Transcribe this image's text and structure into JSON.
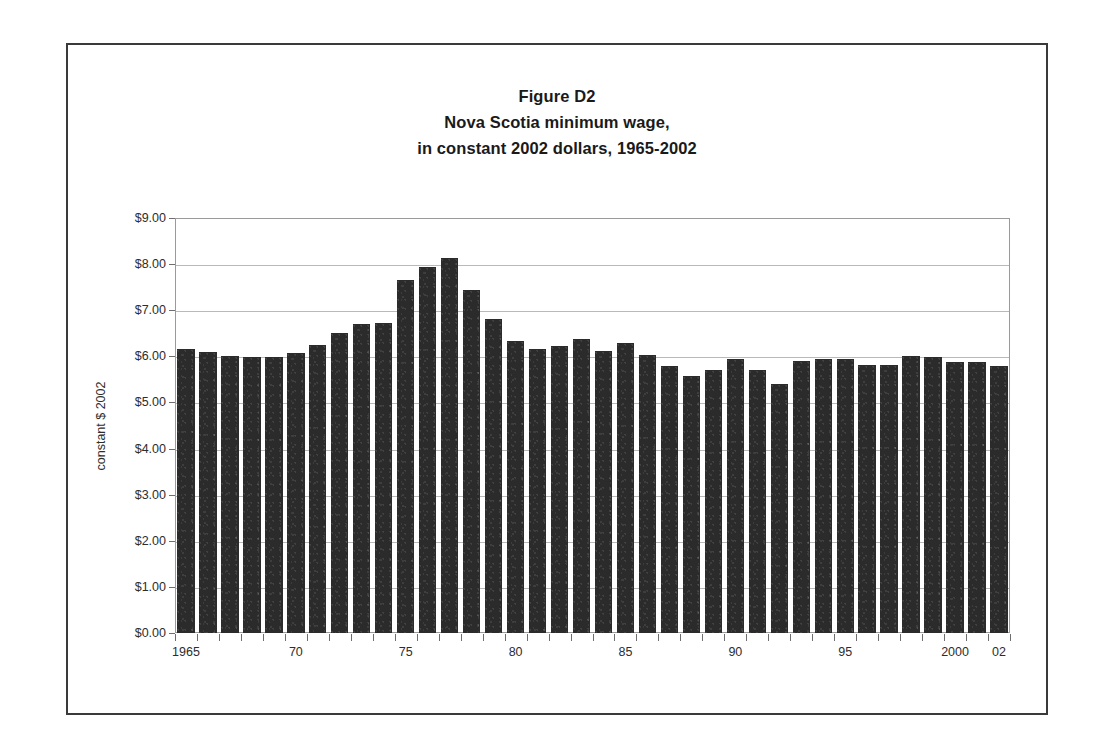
{
  "figure": {
    "title_lines": [
      "Figure D2",
      "Nova Scotia minimum wage,",
      "in constant 2002 dollars, 1965-2002"
    ],
    "border_color": "#3a3a3a"
  },
  "chart_data": {
    "type": "bar",
    "title": "Figure D2 Nova Scotia minimum wage, in constant 2002 dollars, 1965-2002",
    "xlabel": "",
    "ylabel": "constant $ 2002",
    "ylim": [
      0,
      9
    ],
    "ytick_step": 1,
    "ytick_labels": [
      "$0.00",
      "$1.00",
      "$2.00",
      "$3.00",
      "$4.00",
      "$5.00",
      "$6.00",
      "$7.00",
      "$8.00",
      "$9.00"
    ],
    "ytick_values": [
      0,
      1,
      2,
      3,
      4,
      5,
      6,
      7,
      8,
      9
    ],
    "grid": true,
    "legend": false,
    "bar_color": "#2b2b2b",
    "categories": [
      "1965",
      "1966",
      "1967",
      "1968",
      "1969",
      "1970",
      "1971",
      "1972",
      "1973",
      "1974",
      "1975",
      "1976",
      "1977",
      "1978",
      "1979",
      "1980",
      "1981",
      "1982",
      "1983",
      "1984",
      "1985",
      "1986",
      "1987",
      "1988",
      "1989",
      "1990",
      "1991",
      "1992",
      "1993",
      "1994",
      "1995",
      "1996",
      "1997",
      "1998",
      "1999",
      "2000",
      "2001",
      "2002"
    ],
    "values": [
      6.15,
      6.1,
      6.0,
      5.98,
      5.98,
      6.07,
      6.25,
      6.5,
      6.7,
      6.72,
      7.65,
      7.93,
      8.13,
      7.43,
      6.8,
      6.33,
      6.15,
      6.22,
      6.38,
      6.12,
      6.28,
      6.04,
      5.8,
      5.58,
      5.7,
      5.95,
      5.7,
      5.4,
      5.9,
      5.95,
      5.95,
      5.82,
      5.82,
      6.0,
      5.98,
      5.88,
      5.87,
      5.8
    ],
    "xtick_labels": [
      "1965",
      "70",
      "75",
      "80",
      "85",
      "90",
      "95",
      "2000",
      "02"
    ],
    "xtick_categories": [
      "1965",
      "1970",
      "1975",
      "1980",
      "1985",
      "1990",
      "1995",
      "2000",
      "2002"
    ]
  }
}
